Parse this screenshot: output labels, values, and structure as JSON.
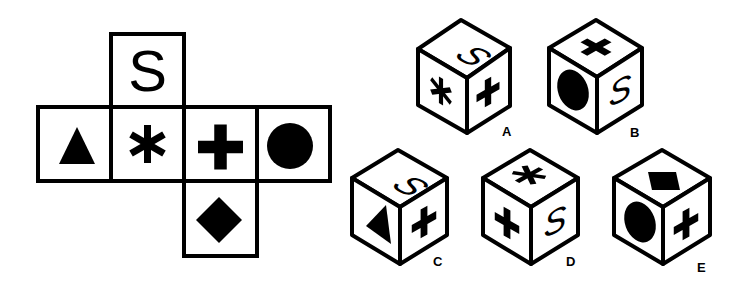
{
  "puzzle": {
    "type": "cube-net-folding",
    "net": {
      "cells": [
        {
          "id": "top",
          "symbol": "S",
          "icon": "letter-s"
        },
        {
          "id": "left",
          "symbol": "triangle",
          "icon": "triangle-icon"
        },
        {
          "id": "center-left",
          "symbol": "asterisk",
          "icon": "asterisk-icon"
        },
        {
          "id": "center-right",
          "symbol": "plus",
          "icon": "plus-icon"
        },
        {
          "id": "right",
          "symbol": "circle",
          "icon": "circle-icon"
        },
        {
          "id": "bottom",
          "symbol": "diamond",
          "icon": "diamond-icon"
        }
      ]
    },
    "options": [
      {
        "label": "A",
        "top": "S",
        "left": "asterisk",
        "right": "plus"
      },
      {
        "label": "B",
        "top": "plus",
        "left": "circle",
        "right": "S"
      },
      {
        "label": "C",
        "top": "S",
        "left": "triangle",
        "right": "plus"
      },
      {
        "label": "D",
        "top": "asterisk",
        "left": "plus",
        "right": "S"
      },
      {
        "label": "E",
        "top": "diamond",
        "left": "circle",
        "right": "plus"
      }
    ]
  },
  "text": {
    "net_letter": "S",
    "cube_letter": "S",
    "label_a": "A",
    "label_b": "B",
    "label_c": "C",
    "label_d": "D",
    "label_e": "E"
  },
  "colors": {
    "ink": "#000000",
    "paper": "#ffffff"
  }
}
